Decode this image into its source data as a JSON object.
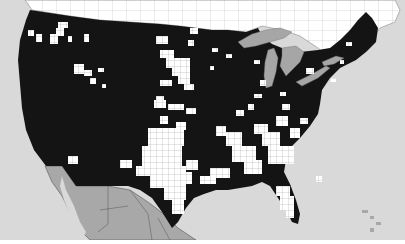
{
  "map": {
    "type": "choropleth-county",
    "region": "Contiguous United States",
    "colors": {
      "ocean": "#d9d9d9",
      "canada": "#ffffff",
      "canada_borders": "#8a8a8a",
      "mexico": "#a8a8a8",
      "mexico_borders": "#555555",
      "great_lakes": "#a6a6a6",
      "us_filled": "#141414",
      "us_unfilled": "#ffffff",
      "county_lines": "#9a9a9a",
      "frame_bottom": "#ffffff"
    },
    "regions": [
      "canada",
      "united-states",
      "mexico",
      "great-lakes",
      "atlantic-ocean",
      "pacific-ocean",
      "gulf-of-mexico",
      "bahamas"
    ],
    "legend": null,
    "labels": []
  }
}
